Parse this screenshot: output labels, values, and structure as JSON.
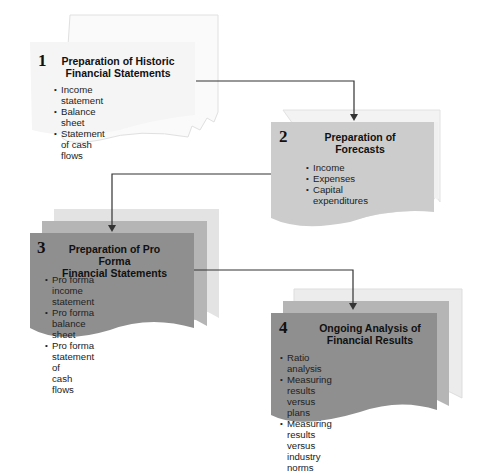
{
  "diagram": {
    "type": "process-flow",
    "steps": [
      {
        "number": "1",
        "title_line1": "Preparation of Historic",
        "title_line2": "Financial Statements",
        "items": [
          "Income statement",
          "Balance sheet",
          "Statement of cash flows"
        ],
        "fill": "#f7f7f7"
      },
      {
        "number": "2",
        "title_line1": "Preparation of",
        "title_line2": "Forecasts",
        "items": [
          "Income",
          "Expenses",
          "Capital expenditures"
        ],
        "fill": "#cccccc"
      },
      {
        "number": "3",
        "title_line1": "Preparation of Pro Forma",
        "title_line2": "Financial Statements",
        "items": [
          "Pro forma income statement",
          "Pro forma balance sheet",
          "Pro forma statement of",
          "cash flows"
        ],
        "fill": "#8f8f8f"
      },
      {
        "number": "4",
        "title_line1": "Ongoing Analysis of",
        "title_line2": "Financial Results",
        "items": [
          "Ratio analysis",
          "Measuring results versus plans",
          "Measuring results versus industry",
          "norms"
        ],
        "fill": "#8f8f8f"
      }
    ],
    "connectors": [
      {
        "from": "1",
        "to": "2"
      },
      {
        "from": "2",
        "to": "3"
      },
      {
        "from": "3",
        "to": "4"
      }
    ],
    "colors": {
      "line": "#333333",
      "sheet_back_light": "#e6e6e6",
      "sheet_back_mid": "#b3b3b3"
    }
  }
}
